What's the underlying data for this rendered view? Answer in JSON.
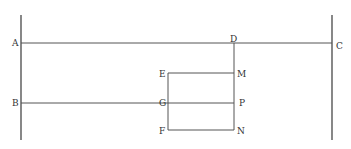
{
  "diagram": {
    "labels": {
      "A": "A",
      "B": "B",
      "C": "C",
      "D": "D",
      "E": "E",
      "F": "F",
      "G": "G",
      "M": "M",
      "N": "N",
      "P": "P"
    },
    "colors": {
      "line": "#555555",
      "text": "#333333",
      "background": "#ffffff"
    }
  }
}
